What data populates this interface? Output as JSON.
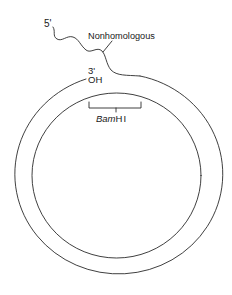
{
  "diagram": {
    "labels": {
      "five_prime": "5'",
      "nonhomologous": "Nonhomologous",
      "three_prime": "3'",
      "hydroxyl": "OH",
      "restriction_site_italic": "Bam",
      "restriction_site_roman": "HI"
    },
    "colors": {
      "line": "#2a2a2a",
      "text": "#1a1a1a",
      "background": "#ffffff"
    },
    "elements": [
      "outer circular DNA strand with open 3'-OH end",
      "inner circular DNA strand",
      "nonhomologous 5' single-stranded tail",
      "BamHI site bracket"
    ]
  }
}
